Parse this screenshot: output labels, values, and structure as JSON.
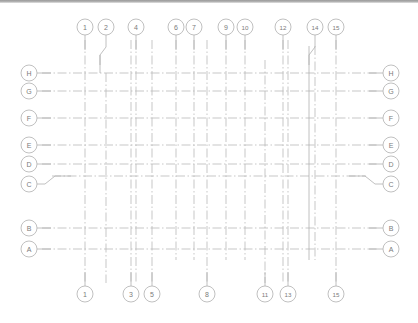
{
  "drawing": {
    "type": "architectural-column-grid-plan",
    "background_color": "#ffffff",
    "line_color": "#b9b9b9",
    "line_color_strong": "#a8a8a8",
    "bubble_stroke": "#b0b0b0",
    "text_color": "#7b7b7b",
    "line_style": "dash-dot centerline",
    "canvas": {
      "width": 418,
      "height": 323
    }
  },
  "top_gridlines": [
    {
      "label": "1",
      "x": 85,
      "leader": "straight"
    },
    {
      "label": "2",
      "x": 106,
      "leader": "jogged"
    },
    {
      "label": "4",
      "x": 136,
      "leader": "straight"
    },
    {
      "label": "6",
      "x": 176,
      "leader": "straight"
    },
    {
      "label": "7",
      "x": 194,
      "leader": "straight"
    },
    {
      "label": "9",
      "x": 226,
      "leader": "straight"
    },
    {
      "label": "10",
      "x": 245,
      "leader": "straight"
    },
    {
      "label": "12",
      "x": 283,
      "leader": "straight"
    },
    {
      "label": "14",
      "x": 315,
      "leader": "jogged"
    },
    {
      "label": "15",
      "x": 336,
      "leader": "straight"
    }
  ],
  "bottom_gridlines": [
    {
      "label": "1",
      "x": 85
    },
    {
      "label": "3",
      "x": 131
    },
    {
      "label": "5",
      "x": 152
    },
    {
      "label": "8",
      "x": 207
    },
    {
      "label": "11",
      "x": 265
    },
    {
      "label": "13",
      "x": 288
    },
    {
      "label": "15",
      "x": 336
    }
  ],
  "row_gridlines": [
    {
      "label": "H",
      "y": 73,
      "leader": "straight"
    },
    {
      "label": "G",
      "y": 91,
      "leader": "straight"
    },
    {
      "label": "F",
      "y": 118,
      "leader": "straight"
    },
    {
      "label": "E",
      "y": 145,
      "leader": "straight"
    },
    {
      "label": "D",
      "y": 164,
      "leader": "straight"
    },
    {
      "label": "C",
      "y": 184,
      "leader": "jogged"
    },
    {
      "label": "B",
      "y": 228,
      "leader": "straight"
    },
    {
      "label": "A",
      "y": 249,
      "leader": "straight"
    }
  ],
  "vertical_lines": [
    {
      "label": "1",
      "x": 85,
      "top": 40,
      "bottom": 283
    },
    {
      "label": "2",
      "x": 106,
      "top": 73,
      "bottom": 283
    },
    {
      "label": "3",
      "x": 131,
      "top": 40,
      "bottom": 283
    },
    {
      "label": "4",
      "x": 136,
      "top": 40,
      "bottom": 283
    },
    {
      "label": "5",
      "x": 152,
      "top": 40,
      "bottom": 283
    },
    {
      "label": "6",
      "x": 176,
      "top": 40,
      "bottom": 260
    },
    {
      "label": "7",
      "x": 194,
      "top": 40,
      "bottom": 260
    },
    {
      "label": "8",
      "x": 207,
      "top": 40,
      "bottom": 283
    },
    {
      "label": "9",
      "x": 226,
      "top": 40,
      "bottom": 260
    },
    {
      "label": "10",
      "x": 245,
      "top": 40,
      "bottom": 260
    },
    {
      "label": "11",
      "x": 265,
      "top": 60,
      "bottom": 283
    },
    {
      "label": "12",
      "x": 283,
      "top": 40,
      "bottom": 283
    },
    {
      "label": "13",
      "x": 288,
      "top": 40,
      "bottom": 283
    },
    {
      "label": "14",
      "x": 315,
      "top": 46,
      "bottom": 260
    },
    {
      "label": "15",
      "x": 336,
      "top": 40,
      "bottom": 283
    }
  ],
  "horizontal_lines": [
    {
      "label": "H",
      "y": 73,
      "left": 42,
      "right": 378
    },
    {
      "label": "G",
      "y": 91,
      "left": 42,
      "right": 378
    },
    {
      "label": "F",
      "y": 118,
      "left": 42,
      "right": 378
    },
    {
      "label": "E",
      "y": 145,
      "left": 42,
      "right": 378
    },
    {
      "label": "D",
      "y": 164,
      "left": 42,
      "right": 378
    },
    {
      "label": "C",
      "y": 176,
      "left": 52,
      "right": 366
    },
    {
      "label": "B",
      "y": 228,
      "left": 42,
      "right": 378
    },
    {
      "label": "A",
      "y": 249,
      "left": 42,
      "right": 378
    }
  ],
  "bubbles": {
    "radius": 8,
    "top_row_cy": 27,
    "bottom_row_cy": 294,
    "left_col_cx": 29,
    "right_col_cx": 391
  }
}
